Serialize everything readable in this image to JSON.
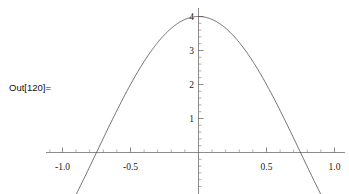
{
  "cell": {
    "out_label": "Out[120]="
  },
  "chart_data": {
    "type": "line",
    "title": "",
    "xlabel": "",
    "ylabel": "",
    "xlim": [
      -1.1,
      1.12
    ],
    "ylim": [
      -1.2,
      4.35
    ],
    "grid": false,
    "legend": null,
    "axis_style": "mathematica-cross-axes",
    "x_ticks_major": [
      -1.0,
      -0.5,
      0.5,
      1.0
    ],
    "x_tick_labels": [
      "-1.0",
      "-0.5",
      "0.5",
      "1.0"
    ],
    "x_ticks_minor_step": 0.1,
    "y_ticks_major": [
      1,
      2,
      3,
      4
    ],
    "y_tick_labels": [
      "1",
      "2",
      "3",
      "4"
    ],
    "y_ticks_minor_step": 0.2,
    "series": [
      {
        "name": "curve",
        "color": "#4a4a4a",
        "linewidth": 0.8,
        "expression": "4*cos(pi*x/1.5)",
        "x": [
          -1.1,
          -1.05,
          -1.0,
          -0.95,
          -0.9,
          -0.85,
          -0.8,
          -0.75,
          -0.7,
          -0.65,
          -0.6,
          -0.55,
          -0.5,
          -0.45,
          -0.4,
          -0.35,
          -0.3,
          -0.25,
          -0.2,
          -0.15,
          -0.1,
          -0.05,
          0.0,
          0.05,
          0.1,
          0.15,
          0.2,
          0.25,
          0.3,
          0.35,
          0.4,
          0.45,
          0.5,
          0.55,
          0.6,
          0.65,
          0.7,
          0.75,
          0.8,
          0.85,
          0.9,
          0.95,
          1.0,
          1.05,
          1.1,
          1.12
        ],
        "y": [
          -1.39,
          -1.19,
          -1.0,
          -0.8,
          -0.6,
          -0.4,
          -0.2,
          0.0,
          0.2,
          0.4,
          0.6,
          0.8,
          1.0,
          1.39,
          1.76,
          2.11,
          2.43,
          2.72,
          2.97,
          3.18,
          3.34,
          3.46,
          4.0,
          3.46,
          3.34,
          3.18,
          2.97,
          2.72,
          2.43,
          2.11,
          1.76,
          1.39,
          1.0,
          0.8,
          0.6,
          0.4,
          0.2,
          0.0,
          -0.2,
          -0.4,
          -0.6,
          -0.8,
          -1.0,
          -1.19,
          -1.39,
          -1.45
        ]
      }
    ],
    "zero_crossings": [
      -0.75,
      0.75
    ],
    "peak": {
      "x": 0.0,
      "y": 4.0
    }
  }
}
